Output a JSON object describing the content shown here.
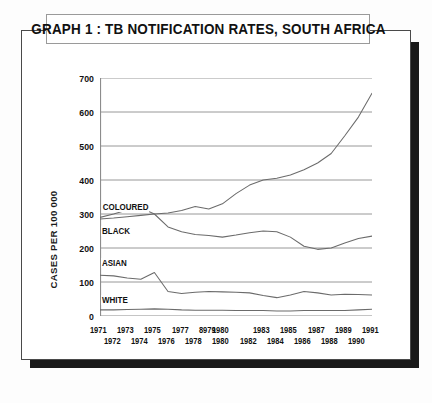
{
  "title": "GRAPH 1 : TB NOTIFICATION RATES, SOUTH AFRICA",
  "axis": {
    "ylabel": "CASES PER 100 000",
    "yticks": [
      "0",
      "100",
      "200",
      "300",
      "400",
      "500",
      "600",
      "700"
    ],
    "xrow_top": [
      "1971",
      "1973",
      "1975",
      "1977",
      "8979",
      "1980",
      "1983",
      "1985",
      "1987",
      "1989",
      "1991"
    ],
    "xrow_bottom": [
      "1972",
      "1974",
      "1976",
      "1978",
      "1980",
      "1982",
      "1984",
      "1986",
      "1988",
      "1990"
    ]
  },
  "series_labels": {
    "coloured": "COLOURED",
    "black": "BLACK",
    "asian": "ASIAN",
    "white": "WHITE"
  },
  "colors": {
    "frame": "#4a4a4a",
    "shadow": "#1a1a1a",
    "grid": "#8c8c8c",
    "line": "#6b6b6b",
    "text": "#111111",
    "background": "#ffffff"
  },
  "chart_data": {
    "type": "line",
    "title": "GRAPH 1 : TB NOTIFICATION RATES, SOUTH AFRICA",
    "xlabel": "",
    "ylabel": "CASES PER 100 000",
    "ylim": [
      0,
      700
    ],
    "xlim": [
      1971,
      1991
    ],
    "grid": true,
    "legend": "inline-labels",
    "x": [
      1971,
      1972,
      1973,
      1974,
      1975,
      1976,
      1977,
      1978,
      1979,
      1980,
      1981,
      1982,
      1983,
      1984,
      1985,
      1986,
      1987,
      1988,
      1989,
      1990,
      1991
    ],
    "series": [
      {
        "name": "COLOURED",
        "values": [
          285,
          288,
          292,
          296,
          300,
          303,
          310,
          322,
          315,
          330,
          360,
          385,
          400,
          405,
          415,
          430,
          450,
          478,
          530,
          585,
          655
        ]
      },
      {
        "name": "BLACK",
        "values": [
          290,
          300,
          312,
          318,
          300,
          262,
          248,
          240,
          237,
          232,
          238,
          245,
          250,
          248,
          232,
          205,
          196,
          200,
          215,
          228,
          235
        ]
      },
      {
        "name": "ASIAN",
        "values": [
          120,
          118,
          112,
          108,
          128,
          72,
          66,
          70,
          72,
          71,
          70,
          68,
          60,
          54,
          62,
          72,
          68,
          62,
          64,
          63,
          62
        ]
      },
      {
        "name": "WHITE",
        "values": [
          18,
          18,
          19,
          20,
          21,
          20,
          18,
          17,
          17,
          17,
          16,
          16,
          16,
          15,
          15,
          16,
          16,
          16,
          16,
          18,
          20
        ]
      }
    ]
  }
}
